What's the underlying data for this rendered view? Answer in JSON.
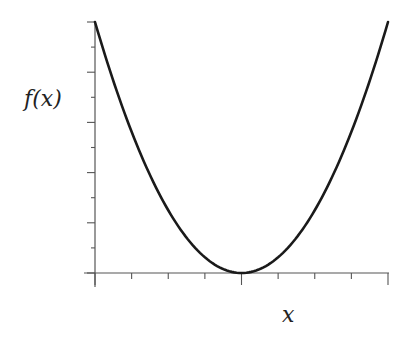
{
  "chart_data": {
    "type": "line",
    "title": "",
    "xlabel": "x",
    "ylabel": "f(x)",
    "function": "f(x) = x^2 (parabola, minimum at origin)",
    "x": [
      -4,
      -3,
      -2,
      -1,
      0,
      1,
      2,
      3,
      4
    ],
    "series": [
      {
        "name": "f(x)",
        "values": [
          16,
          9,
          4,
          1,
          0,
          1,
          4,
          9,
          16
        ]
      }
    ],
    "xlim": [
      -4,
      4
    ],
    "ylim": [
      0,
      16
    ],
    "x_ticks": 9,
    "y_major_ticks": 6,
    "y_minor_ticks": 5,
    "tick_labels": false,
    "grid": false,
    "legend": false,
    "line_color": "#1a1a1a"
  },
  "labels": {
    "y_axis": "f(x)",
    "x_axis": "x"
  }
}
